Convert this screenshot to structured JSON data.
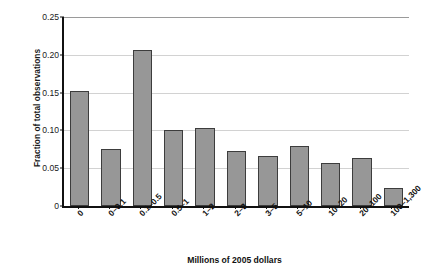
{
  "chart_data": {
    "type": "bar",
    "title": "",
    "subtitle": "",
    "xlabel": "Millions of 2005 dollars",
    "ylabel": "Fraction of total observations",
    "categories": [
      "0",
      "0–0.1",
      "0.1–0.5",
      "0.5–1",
      "1–2",
      "2–3",
      "3–5",
      "5–10",
      "10–20",
      "20–100",
      "100–1,300"
    ],
    "values": [
      0.152,
      0.075,
      0.206,
      0.101,
      0.103,
      0.073,
      0.066,
      0.08,
      0.057,
      0.064,
      0.024
    ],
    "ylim": [
      0,
      0.25
    ],
    "yticks": [
      0,
      0.05,
      0.1,
      0.15,
      0.2,
      0.25
    ],
    "ytick_labels": [
      "0",
      "0.05",
      "0.10",
      "0.15",
      "0.20",
      "0.25"
    ],
    "grid": "horizontal",
    "legend": "none",
    "bar_color": "#979797",
    "bar_edge_color": "#3d3d3d",
    "grid_color": "#d2d2d2",
    "axis_color": "#111111",
    "background": "#ffffff",
    "xtick_rotation": -45
  }
}
